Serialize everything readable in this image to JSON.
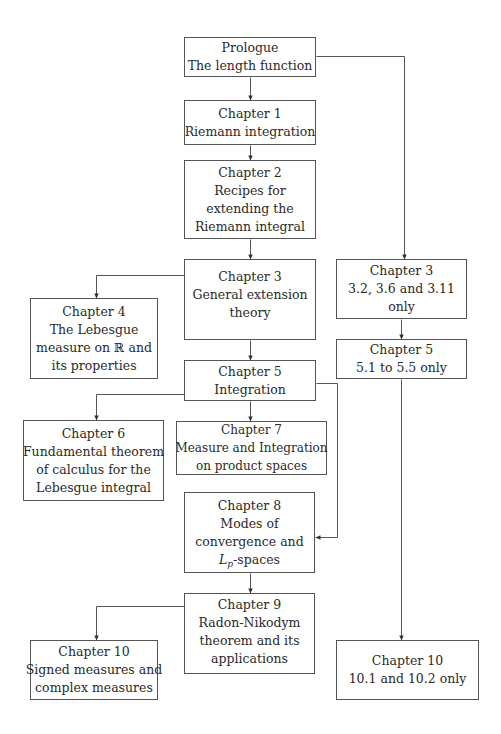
{
  "diagram": {
    "type": "chapter-dependency-flowchart",
    "nodes": [
      {
        "id": "prologue",
        "title": "Prologue",
        "lines": [
          "The length function"
        ]
      },
      {
        "id": "ch1",
        "title": "Chapter 1",
        "lines": [
          "Riemann integration"
        ]
      },
      {
        "id": "ch2",
        "title": "Chapter 2",
        "lines": [
          "Recipes for",
          "extending the",
          "Riemann integral"
        ]
      },
      {
        "id": "ch3",
        "title": "Chapter 3",
        "lines": [
          "General extension",
          "theory"
        ]
      },
      {
        "id": "ch3-partial",
        "title": "Chapter 3",
        "lines": [
          "3.2, 3.6 and 3.11",
          "only"
        ]
      },
      {
        "id": "ch4",
        "title": "Chapter 4",
        "lines": [
          "The Lebesgue",
          "measure on ℝ and",
          "its properties"
        ]
      },
      {
        "id": "ch5",
        "title": "Chapter 5",
        "lines": [
          "Integration"
        ]
      },
      {
        "id": "ch5-partial",
        "title": "Chapter 5",
        "lines": [
          "5.1 to 5.5 only"
        ]
      },
      {
        "id": "ch6",
        "title": "Chapter 6",
        "lines": [
          "Fundamental theorem",
          "of calculus for the",
          "Lebesgue integral"
        ]
      },
      {
        "id": "ch7",
        "title": "Chapter 7",
        "lines": [
          "Measure and Integration",
          "on product spaces"
        ]
      },
      {
        "id": "ch8",
        "title": "Chapter 8",
        "lines": [
          "Modes of",
          "convergence and"
        ],
        "math_line": {
          "symbol": "L",
          "subscript": "p",
          "suffix": "-spaces"
        }
      },
      {
        "id": "ch9",
        "title": "Chapter 9",
        "lines": [
          "Radon-Nikodym",
          "theorem and its",
          "applications"
        ]
      },
      {
        "id": "ch10",
        "title": "Chapter 10",
        "lines": [
          "Signed measures and",
          "complex measures"
        ]
      },
      {
        "id": "ch10-partial",
        "title": "Chapter 10",
        "lines": [
          "10.1 and 10.2 only"
        ]
      }
    ],
    "edges": [
      {
        "from": "prologue",
        "to": "ch1"
      },
      {
        "from": "prologue",
        "to": "ch3-partial"
      },
      {
        "from": "ch1",
        "to": "ch2"
      },
      {
        "from": "ch2",
        "to": "ch3"
      },
      {
        "from": "ch3",
        "to": "ch4"
      },
      {
        "from": "ch3",
        "to": "ch5"
      },
      {
        "from": "ch3-partial",
        "to": "ch5-partial"
      },
      {
        "from": "ch5",
        "to": "ch6"
      },
      {
        "from": "ch5",
        "to": "ch7"
      },
      {
        "from": "ch5",
        "to": "ch8"
      },
      {
        "from": "ch8",
        "to": "ch9"
      },
      {
        "from": "ch9",
        "to": "ch10"
      },
      {
        "from": "ch5-partial",
        "to": "ch10-partial"
      }
    ],
    "colors": {
      "line": "#555555",
      "arrowhead": "#333333",
      "text": "#2a2a2a",
      "background": "#ffffff"
    }
  }
}
